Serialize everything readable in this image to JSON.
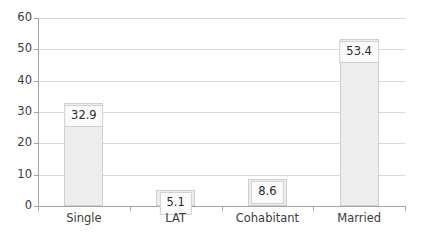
{
  "chart_data": {
    "type": "bar",
    "title": "",
    "subtitle": "",
    "xlabel": "",
    "ylabel": "",
    "categories": [
      "Single",
      "LAT",
      "Cohabitant",
      "Married"
    ],
    "values": [
      32.9,
      5.1,
      8.6,
      53.4
    ],
    "value_labels": [
      "32.9",
      "5.1",
      "8.6",
      "53.4"
    ],
    "series": [
      {
        "name": "",
        "values": [
          32.9,
          5.1,
          8.6,
          53.4
        ]
      }
    ],
    "ylim": [
      0,
      60
    ],
    "ytick_values": [
      0,
      10,
      20,
      30,
      40,
      50,
      60
    ],
    "ytick_labels": [
      "0",
      "10",
      "20",
      "30",
      "40",
      "50",
      "60"
    ],
    "grid": true,
    "grid_axis": "y",
    "legend": false,
    "legend_position": "none",
    "annotations": [],
    "colors": {
      "bar_fill": "#ededed",
      "bar_border": "#cfcfcf",
      "gridline": "#d9d9d9",
      "axis_line": "#a6a6a6",
      "text": "#3b3b3b",
      "label_box_fill": "#fbfbfb",
      "label_box_border": "#d2d2d2",
      "background": "#ffffff"
    }
  }
}
